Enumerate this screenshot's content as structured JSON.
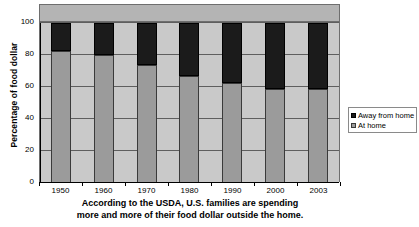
{
  "chart_data": {
    "type": "bar",
    "subtype": "stacked-100-percent",
    "title": "",
    "xlabel": "",
    "ylabel": "Percentage of food dollar",
    "categories": [
      "1950",
      "1960",
      "1970",
      "1980",
      "1990",
      "2000",
      "2003"
    ],
    "series": [
      {
        "name": "At home",
        "color": "#9b9b9b",
        "values": [
          82.5,
          80,
          74,
          67,
          62.5,
          59,
          59
        ]
      },
      {
        "name": "Away from home",
        "color": "#1b1b1b",
        "values": [
          17.5,
          20,
          26,
          33,
          37.5,
          41,
          41
        ]
      }
    ],
    "ylim": [
      0,
      100
    ],
    "yticks": [
      0,
      20,
      40,
      60,
      80,
      100
    ],
    "ytick_labels": [
      "0",
      "20",
      "40",
      "60",
      "80",
      "100"
    ],
    "grid": true,
    "grid_axis": "y",
    "legend_position": "right",
    "stack_order": [
      "At home",
      "Away from home"
    ]
  },
  "axes": {
    "y_title": "Percentage of food dollar",
    "y_ticks": [
      {
        "label": "100",
        "value": 100
      },
      {
        "label": "80",
        "value": 80
      },
      {
        "label": "60",
        "value": 60
      },
      {
        "label": "40",
        "value": 40
      },
      {
        "label": "20",
        "value": 20
      },
      {
        "label": "0",
        "value": 0
      }
    ],
    "x_ticks": [
      {
        "label": "1950"
      },
      {
        "label": "1960"
      },
      {
        "label": "1970"
      },
      {
        "label": "1980"
      },
      {
        "label": "1990"
      },
      {
        "label": "2000"
      },
      {
        "label": "2003"
      }
    ]
  },
  "legend": {
    "entries": [
      {
        "label": "Away from home",
        "swatch": "dark"
      },
      {
        "label": "At home",
        "swatch": "gray"
      }
    ]
  },
  "caption": {
    "line1": "According to the USDA, U.S. families are spending",
    "line2": "more and more of their food dollar outside the home."
  },
  "colors": {
    "at_home": "#9b9b9b",
    "away_from_home": "#1b1b1b",
    "plot_background": "#c9c9c9",
    "header_band": "#b4b4b4",
    "gridline": "#5e5e5e",
    "axis": "#000000",
    "page_background": "#ffffff"
  }
}
